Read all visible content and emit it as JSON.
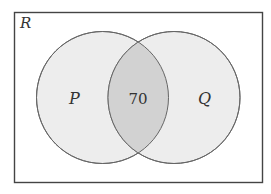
{
  "diagram": {
    "type": "venn",
    "universe_label": "R",
    "sets": [
      {
        "label": "P"
      },
      {
        "label": "Q"
      }
    ],
    "intersection_value": "70",
    "colors": {
      "border": "#555555",
      "circle_fill": "#ececec",
      "intersection_fill": "#d0d0d0",
      "background": "#ffffff"
    }
  }
}
